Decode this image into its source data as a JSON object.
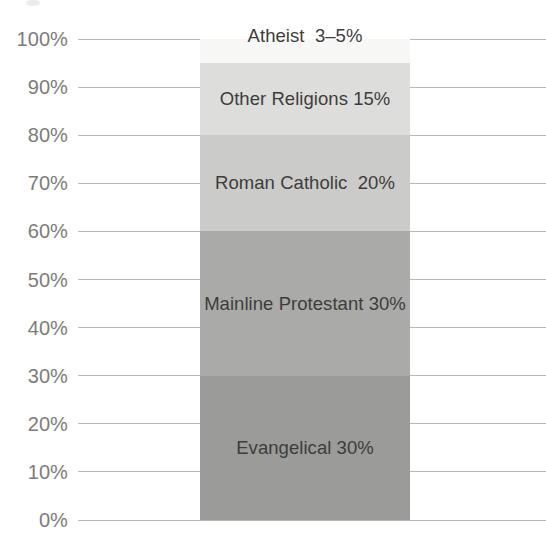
{
  "chart_data": {
    "type": "bar",
    "subtype": "stacked-single-column-100percent",
    "title": "",
    "subtitle": "",
    "xlabel": "",
    "ylabel": "",
    "categories": [
      ""
    ],
    "ylim": [
      0,
      100
    ],
    "grid": true,
    "grid_axis": "y",
    "legend": "none",
    "legend_position": "none",
    "value_labels_inside_bars": true,
    "ytick_labels": [
      "100%",
      "90%",
      "80%",
      "70%",
      "60%",
      "50%",
      "40%",
      "30%",
      "20%",
      "10%",
      "0%"
    ],
    "ytick_values": [
      100,
      90,
      80,
      70,
      60,
      50,
      40,
      30,
      20,
      10,
      0
    ],
    "series": [
      {
        "name": "Evangelical",
        "label": "Evangelical 30%",
        "value": 30,
        "range_start": 0,
        "range_end": 30,
        "color": "#9b9b99"
      },
      {
        "name": "Mainline Protestant",
        "label": "Mainline Protestant 30%",
        "value": 30,
        "range_start": 30,
        "range_end": 60,
        "color": "#aaaaa8"
      },
      {
        "name": "Roman Catholic",
        "label": "Roman Catholic  20%",
        "value": 20,
        "range_start": 60,
        "range_end": 80,
        "color": "#cbcbc9"
      },
      {
        "name": "Other Religions",
        "label": "Other Religions 15%",
        "value": 15,
        "range_start": 80,
        "range_end": 95,
        "color": "#dddddb"
      },
      {
        "name": "Atheist",
        "label": "Atheist  3–5%",
        "value": 5,
        "range_start": 95,
        "range_end": 100,
        "color": "#f7f7f5"
      }
    ],
    "colors": {
      "gridline": "#b9b9b7",
      "axis_text": "#7c7c7a",
      "bar_label_text": "#3d3d3b",
      "background": "#ffffff"
    }
  }
}
